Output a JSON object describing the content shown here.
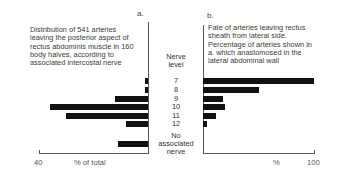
{
  "panels": {
    "a": {
      "letter": "a.",
      "description": [
        "Distribution of 541 arteries",
        "leaving the posterior aspect of",
        "rectus abdominis muscle in 160",
        "body halves, according to",
        "associated intercostal nerve"
      ],
      "axis_min_label": "40",
      "axis_label": "% of total"
    },
    "b": {
      "letter": "b.",
      "description": [
        "Fate of arteries leaving rectus",
        "sheath from lateral side.",
        "Percentage of arteries shown in",
        "a. which anastomosed in the",
        "lateral abdominal wall"
      ],
      "axis_label": "%",
      "axis_max_label": "100"
    }
  },
  "center": {
    "title_line1": "Nerve",
    "title_line2": "level",
    "levels": [
      "7",
      "8",
      "9",
      "10",
      "11",
      "12"
    ],
    "no_assoc": [
      "No",
      "associated",
      "nerve"
    ]
  },
  "chart_data": [
    {
      "type": "bar",
      "orientation": "horizontal",
      "title": "Distribution of 541 arteries leaving the posterior aspect of rectus abdominis muscle in 160 body halves, according to associated intercostal nerve",
      "panel": "a.",
      "categories": [
        "7",
        "8",
        "9",
        "10",
        "11",
        "12",
        "No associated nerve"
      ],
      "values": [
        1,
        1,
        12,
        36,
        30,
        8,
        11
      ],
      "xlabel": "% of total",
      "ylabel": "Nerve level",
      "xlim": [
        40,
        0
      ],
      "direction": "bars extend leftward from axis",
      "grid": false
    },
    {
      "type": "bar",
      "orientation": "horizontal",
      "title": "Fate of arteries leaving rectus sheath from lateral side. Percentage of arteries shown in a. which anastomosed in the lateral abdominal wall",
      "panel": "b.",
      "categories": [
        "7",
        "8",
        "9",
        "10",
        "11",
        "12"
      ],
      "values": [
        100,
        50,
        18,
        20,
        12,
        4
      ],
      "xlabel": "%",
      "ylabel": "Nerve level",
      "xlim": [
        0,
        100
      ],
      "grid": false
    }
  ],
  "colors": {
    "bar": "#111111",
    "axis": "#555555",
    "text": "#333333"
  }
}
